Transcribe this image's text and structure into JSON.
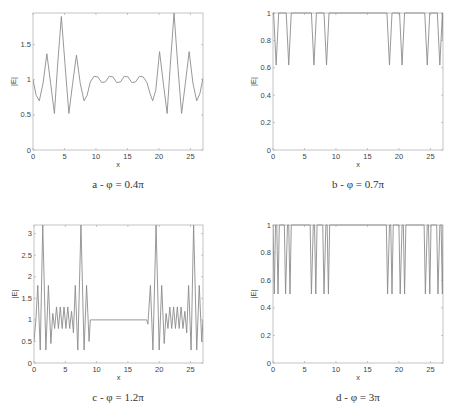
{
  "colors": {
    "line": "#8c8c8c",
    "axis": "#b5b5b5",
    "tick_text": "#444444"
  },
  "chart_data": [
    {
      "id": "a",
      "type": "line",
      "title": "",
      "caption": "a - φ = 0.4π",
      "xlabel": "x",
      "ylabel": "|E|",
      "xlim": [
        0,
        27
      ],
      "ylim": [
        0,
        1.95
      ],
      "xticks": [
        0,
        5,
        10,
        15,
        20,
        25
      ],
      "yticks": [
        0,
        0.5,
        1,
        1.5
      ],
      "ytick_labels": [
        "0",
        "0.5",
        "1",
        "1.5"
      ],
      "grid": false,
      "box": {
        "left": 33,
        "top": 13,
        "right": 203,
        "bottom": 150
      },
      "caption_pos": {
        "x": 118,
        "y": 185
      },
      "x": [
        0,
        0.5,
        1.0,
        1.6,
        2.2,
        2.8,
        3.4,
        3.9,
        4.5,
        5.1,
        5.7,
        6.3,
        6.9,
        7.5,
        8.1,
        8.6,
        9.1,
        9.7,
        10.3,
        10.9,
        11.5,
        12.1,
        12.7,
        13.3,
        13.9,
        14.5,
        15.1,
        15.7,
        16.3,
        16.9,
        17.5,
        18.1,
        18.6,
        19.0,
        19.5,
        20.1,
        20.7,
        21.3,
        21.8,
        22.4,
        23.0,
        23.6,
        24.2,
        24.8,
        25.4,
        26.0,
        26.5,
        27.0
      ],
      "values": [
        1.0,
        0.78,
        0.7,
        0.95,
        1.37,
        0.95,
        0.52,
        1.2,
        1.9,
        1.2,
        0.52,
        0.95,
        1.35,
        0.95,
        0.7,
        0.78,
        0.97,
        1.05,
        1.04,
        0.96,
        0.97,
        1.05,
        1.04,
        0.96,
        0.97,
        1.05,
        1.04,
        0.96,
        0.97,
        1.05,
        1.04,
        0.96,
        0.8,
        0.7,
        0.85,
        1.4,
        0.95,
        0.52,
        1.2,
        1.95,
        1.2,
        0.52,
        0.95,
        1.4,
        0.95,
        0.7,
        0.8,
        1.02
      ]
    },
    {
      "id": "b",
      "type": "line",
      "title": "",
      "caption": "b - φ = 0.7π",
      "xlabel": "x",
      "ylabel": "|E|",
      "xlim": [
        0,
        27
      ],
      "ylim": [
        0,
        1
      ],
      "xticks": [
        0,
        5,
        10,
        15,
        20,
        25
      ],
      "yticks": [
        0,
        0.2,
        0.4,
        0.6,
        0.8,
        1
      ],
      "ytick_labels": [
        "0",
        "0.2",
        "0.4",
        "0.6",
        "0.8",
        "1"
      ],
      "grid": false,
      "box": {
        "left": 273,
        "top": 13,
        "right": 443,
        "bottom": 150
      },
      "caption_pos": {
        "x": 358,
        "y": 185
      },
      "x": [
        0,
        0.1,
        0.5,
        0.9,
        2.1,
        2.5,
        2.9,
        6.1,
        6.5,
        6.9,
        8.1,
        8.5,
        8.9,
        18.1,
        18.5,
        18.9,
        20.1,
        20.5,
        20.9,
        24.1,
        24.5,
        24.9,
        26.1,
        26.5,
        26.9,
        27.0
      ],
      "values": [
        1,
        1,
        0.62,
        1,
        1,
        0.62,
        1,
        1,
        0.62,
        1,
        1,
        0.62,
        1,
        1,
        0.62,
        1,
        1,
        0.62,
        1,
        1,
        0.62,
        1,
        1,
        0.62,
        1,
        0.8
      ]
    },
    {
      "id": "c",
      "type": "line",
      "title": "",
      "caption": "c - φ = 1.2π",
      "xlabel": "x",
      "ylabel": "|E|",
      "xlim": [
        0,
        27
      ],
      "ylim": [
        0,
        3.2
      ],
      "xticks": [
        0,
        5,
        10,
        15,
        20,
        25
      ],
      "yticks": [
        0,
        0.5,
        1,
        1.5,
        2,
        2.5,
        3
      ],
      "ytick_labels": [
        "0",
        "0.5",
        "1",
        "1.5",
        "2",
        "2.5",
        "3"
      ],
      "grid": false,
      "box": {
        "left": 34,
        "top": 225,
        "right": 203,
        "bottom": 363
      },
      "caption_pos": {
        "x": 118,
        "y": 398
      },
      "x": [
        0,
        0.3,
        0.6,
        1.0,
        1.4,
        1.9,
        2.3,
        2.7,
        3.0,
        3.3,
        3.6,
        3.9,
        4.2,
        4.5,
        4.8,
        5.1,
        5.4,
        5.7,
        6.0,
        6.3,
        6.6,
        7.0,
        7.5,
        8.0,
        8.4,
        8.8,
        9.0,
        18.0,
        18.2,
        18.6,
        19.0,
        19.5,
        20.0,
        20.4,
        20.8,
        21.1,
        21.4,
        21.7,
        22.0,
        22.3,
        22.6,
        22.9,
        23.2,
        23.5,
        23.8,
        24.1,
        24.4,
        24.7,
        25.1,
        25.5,
        26.0,
        26.4,
        26.8,
        27.0
      ],
      "values": [
        0.5,
        1.0,
        1.8,
        0.3,
        3.2,
        0.3,
        1.8,
        0.45,
        1.15,
        0.8,
        1.3,
        0.8,
        1.3,
        0.8,
        1.3,
        0.8,
        1.3,
        0.8,
        1.2,
        0.7,
        1.8,
        0.3,
        3.2,
        0.3,
        1.8,
        0.5,
        1.0,
        1.0,
        0.9,
        1.8,
        0.3,
        3.2,
        0.3,
        1.8,
        0.45,
        1.15,
        0.8,
        1.3,
        0.8,
        1.3,
        0.8,
        1.3,
        0.8,
        1.3,
        0.8,
        1.2,
        0.7,
        1.8,
        0.3,
        3.2,
        0.3,
        1.8,
        0.5,
        1.0
      ]
    },
    {
      "id": "d",
      "type": "line",
      "title": "",
      "caption": "d - φ = 3π",
      "xlabel": "x",
      "ylabel": "|E|",
      "xlim": [
        0,
        27
      ],
      "ylim": [
        0,
        1
      ],
      "xticks": [
        0,
        5,
        10,
        15,
        20,
        25
      ],
      "yticks": [
        0,
        0.2,
        0.4,
        0.6,
        0.8,
        1
      ],
      "ytick_labels": [
        "0",
        "0.2",
        "0.4",
        "0.6",
        "0.8",
        "1"
      ],
      "grid": false,
      "box": {
        "left": 273,
        "top": 225,
        "right": 443,
        "bottom": 363
      },
      "caption_pos": {
        "x": 358,
        "y": 398
      },
      "x": [
        0,
        0.2,
        0.4,
        0.6,
        0.8,
        1.0,
        1.8,
        2.0,
        2.3,
        2.5,
        2.7,
        2.9,
        5.9,
        6.1,
        6.4,
        6.6,
        6.8,
        7.0,
        7.9,
        8.1,
        8.4,
        8.6,
        8.8,
        9.0,
        18.0,
        18.2,
        18.5,
        18.7,
        18.9,
        19.1,
        20.0,
        20.2,
        20.5,
        20.7,
        20.9,
        21.1,
        24.0,
        24.2,
        24.5,
        24.7,
        24.9,
        25.1,
        26.0,
        26.2,
        26.5,
        26.7,
        26.9,
        27.0
      ],
      "values": [
        1,
        0.5,
        1,
        1,
        0.5,
        1,
        1,
        0.5,
        1,
        1,
        0.5,
        1,
        1,
        0.5,
        1,
        1,
        0.5,
        1,
        1,
        0.5,
        1,
        1,
        0.5,
        1,
        1,
        0.5,
        1,
        1,
        0.5,
        1,
        1,
        0.5,
        1,
        1,
        0.5,
        1,
        1,
        0.5,
        1,
        1,
        0.5,
        1,
        1,
        0.5,
        1,
        1,
        0.5,
        1
      ]
    }
  ]
}
